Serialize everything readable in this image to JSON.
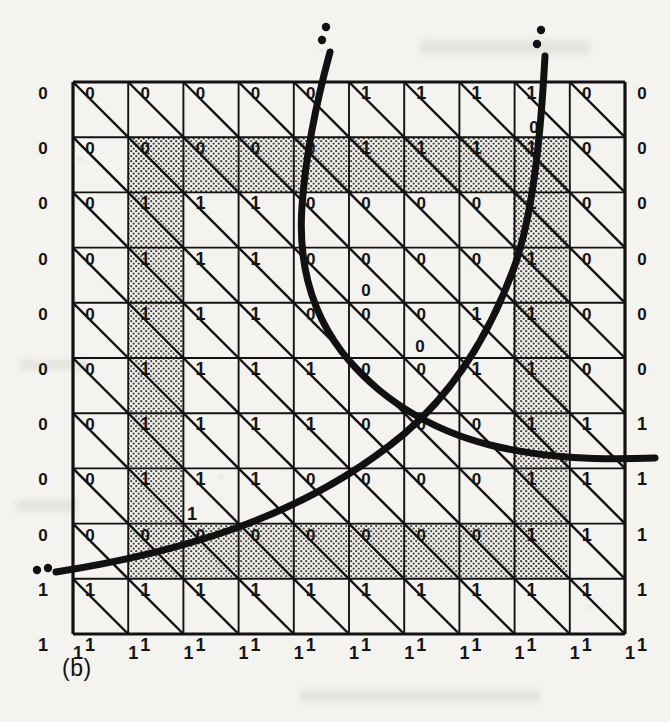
{
  "figure": {
    "caption": "(b)",
    "type": "triangulated-grid-level-set-diagram",
    "background_color": "#f4f3f0",
    "ink_color": "#111111"
  },
  "grid": {
    "origin_x": 73,
    "origin_y": 82,
    "cell_size": 55.2,
    "cols": 10,
    "rows": 10,
    "diagonal_direction": "NW-SE",
    "line_color": "#121212"
  },
  "node_labels": {
    "note": "11x11 lattice of binary sign labels; row 0 = top, col 0 = left grid boundary; col -1 values drawn outside the grid at the left margin",
    "left_margin": [
      "0",
      "0",
      "0",
      "0",
      "0",
      "0",
      "0",
      "0",
      "0",
      "1",
      "1"
    ],
    "rows": [
      [
        "0",
        "0",
        "0",
        "0",
        "0",
        "1",
        "1",
        "1",
        "1",
        "0",
        "0"
      ],
      [
        "0",
        "0",
        "0",
        "0",
        "0",
        "1",
        "1",
        "1",
        "1",
        "0",
        "0"
      ],
      [
        "0",
        "1",
        "1",
        "1",
        "0",
        "0",
        "0",
        "0",
        "1",
        "0",
        "0"
      ],
      [
        "0",
        "1",
        "1",
        "1",
        "0",
        "0",
        "0",
        "0",
        "1",
        "0",
        "0"
      ],
      [
        "0",
        "1",
        "1",
        "1",
        "0",
        "0",
        "0",
        "1",
        "1",
        "0",
        "0"
      ],
      [
        "0",
        "1",
        "1",
        "1",
        "1",
        "0",
        "0",
        "1",
        "1",
        "0",
        "0"
      ],
      [
        "0",
        "1",
        "1",
        "1",
        "1",
        "0",
        "0",
        "0",
        "1",
        "1",
        "1"
      ],
      [
        "0",
        "1",
        "1",
        "1",
        "0",
        "0",
        "0",
        "0",
        "1",
        "1",
        "1"
      ],
      [
        "0",
        "0",
        "0",
        "0",
        "0",
        "0",
        "0",
        "0",
        "1",
        "1",
        "1"
      ],
      [
        "1",
        "1",
        "1",
        "1",
        "1",
        "1",
        "1",
        "1",
        "1",
        "1",
        "1"
      ],
      [
        "1",
        "1",
        "1",
        "1",
        "1",
        "1",
        "1",
        "1",
        "1",
        "1",
        "1"
      ]
    ],
    "extra_labels": [
      {
        "text": "0",
        "x": 534,
        "y": 133
      },
      {
        "text": "0",
        "x": 366,
        "y": 296
      },
      {
        "text": "0",
        "x": 420,
        "y": 352
      },
      {
        "text": "1",
        "x": 192,
        "y": 520
      }
    ],
    "bottom_row": [
      "1",
      "1",
      "1",
      "1",
      "1",
      "1",
      "1",
      "1",
      "1",
      "1",
      "1"
    ]
  },
  "shading": {
    "fill_color": "#b9b6ae",
    "pattern": "stipple-dots",
    "description": "boundary band of shaded triangles following the zero level set of the sign field",
    "bands": [
      {
        "name": "top-horizontal-band",
        "x": 128,
        "y": 138,
        "w": 440,
        "h": 55
      },
      {
        "name": "left-vertical-band",
        "x": 128,
        "y": 138,
        "w": 55,
        "h": 400
      },
      {
        "name": "bottom-horizontal-band",
        "x": 128,
        "y": 524,
        "w": 440,
        "h": 55
      },
      {
        "name": "right-vertical-band",
        "x": 513,
        "y": 138,
        "w": 55,
        "h": 441
      }
    ]
  },
  "curves": [
    {
      "name": "curve-1-parabola-opening-right",
      "stroke_width": 7,
      "color": "#111111",
      "endpoint_dots_top": [
        {
          "x": 326,
          "y": 27
        },
        {
          "x": 322,
          "y": 40
        }
      ],
      "endpoint_dots_left": [
        {
          "x": 37,
          "y": 570
        },
        {
          "x": 48,
          "y": 568
        }
      ],
      "path": "M 330 52 C 318 96 306 150 302 206 C 298 262 310 310 342 352 C 378 398 430 430 490 445 C 548 459 600 460 655 458"
    },
    {
      "name": "curve-2-monotone-rising",
      "stroke_width": 7,
      "color": "#111111",
      "endpoint_dots_top": [
        {
          "x": 541,
          "y": 30
        },
        {
          "x": 537,
          "y": 44
        }
      ],
      "path": "M 56 572 C 120 562 180 548 236 528 C 300 505 356 474 404 434 C 456 390 492 330 516 262 C 534 208 541 130 545 56"
    }
  ],
  "legend": {
    "symbol_zero": "0",
    "symbol_one": "1"
  }
}
